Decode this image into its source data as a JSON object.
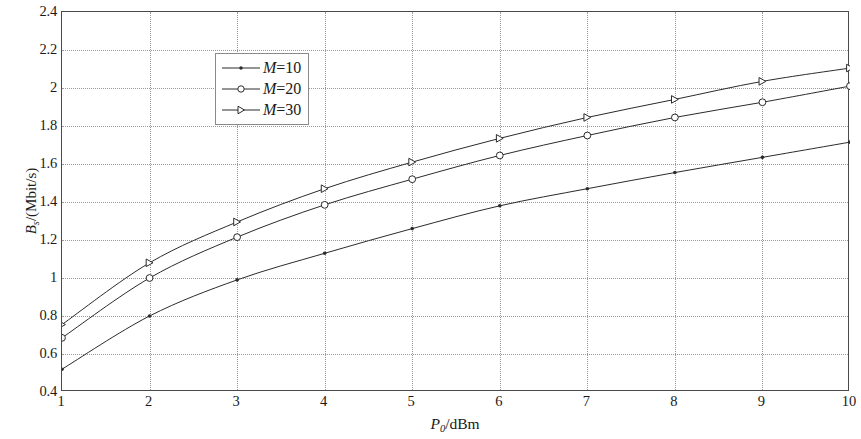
{
  "chart_data": {
    "type": "line",
    "title": "",
    "subtitle": "",
    "xlabel": "P0/dBm",
    "ylabel": "Bs/(Mbit/s)",
    "xlim": [
      1,
      10
    ],
    "ylim": [
      0.4,
      2.4
    ],
    "xticks": [
      1,
      2,
      3,
      4,
      5,
      6,
      7,
      8,
      9,
      10
    ],
    "yticks": [
      0.4,
      0.6,
      0.8,
      1,
      1.2,
      1.4,
      1.6,
      1.8,
      2,
      2.2,
      2.4
    ],
    "ytick_labels": [
      "0.4",
      "0.6",
      "0.8",
      "1",
      "1.2",
      "1.4",
      "1.6",
      "1.8",
      "2",
      "2.2",
      "2.4"
    ],
    "xtick_labels": [
      "1",
      "2",
      "3",
      "4",
      "5",
      "6",
      "7",
      "8",
      "9",
      "10"
    ],
    "grid": true,
    "grid_style": "dotted",
    "legend_position": "upper left",
    "x": [
      1,
      2,
      3,
      4,
      5,
      6,
      7,
      8,
      9,
      10
    ],
    "series": [
      {
        "name": "M=10",
        "marker": "dot",
        "color": "#2b2b2b",
        "values": [
          0.52,
          0.8,
          0.99,
          1.13,
          1.26,
          1.38,
          1.47,
          1.555,
          1.635,
          1.715
        ]
      },
      {
        "name": "M=20",
        "marker": "circle",
        "color": "#2b2b2b",
        "values": [
          0.685,
          1.0,
          1.215,
          1.385,
          1.52,
          1.645,
          1.75,
          1.845,
          1.925,
          2.01
        ]
      },
      {
        "name": "M=30",
        "marker": "triangle-right",
        "color": "#2b2b2b",
        "values": [
          0.755,
          1.08,
          1.295,
          1.47,
          1.61,
          1.735,
          1.845,
          1.94,
          2.035,
          2.105
        ]
      }
    ]
  },
  "axis": {
    "y_label_main": "B",
    "y_label_sub": "s",
    "y_label_unit": "/(Mbit/s)",
    "x_label_main": "P",
    "x_label_sub": "0",
    "x_label_unit": "/dBm"
  },
  "legend": {
    "entries": [
      {
        "prefix": "M",
        "suffix": "=10"
      },
      {
        "prefix": "M",
        "suffix": "=20"
      },
      {
        "prefix": "M",
        "suffix": "=30"
      }
    ]
  },
  "style": {
    "line_color": "#2b2b2b",
    "grid_color": "#9a9a9a",
    "frame_color": "#4a4a4a",
    "background": "#ffffff"
  }
}
